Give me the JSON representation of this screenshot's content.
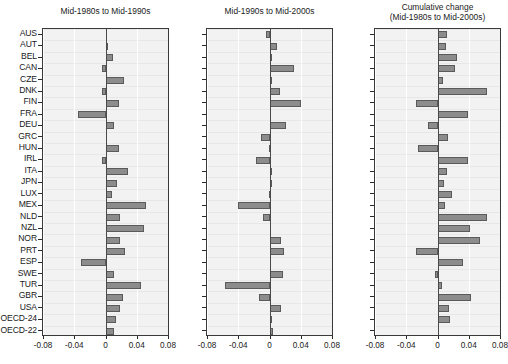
{
  "chart_data": {
    "type": "bar",
    "orientation": "horizontal",
    "title": "",
    "categories": [
      "AUS",
      "AUT",
      "BEL",
      "CAN",
      "CZE",
      "DNK",
      "FIN",
      "FRA",
      "DEU",
      "GRC",
      "HUN",
      "IRL",
      "ITA",
      "JPN",
      "LUX",
      "MEX",
      "NLD",
      "NZL",
      "NOR",
      "PRT",
      "ESP",
      "SWE",
      "TUR",
      "GBR",
      "USA",
      "OECD-24",
      "OECD-22"
    ],
    "xlabel": "",
    "ylabel": "",
    "xlim": [
      -0.08,
      0.08
    ],
    "xticks": [
      -0.08,
      -0.04,
      0,
      0.04,
      0.08
    ],
    "xticklabels": [
      "-0.08",
      "-0.04",
      "0",
      "0.04",
      "0.08"
    ],
    "grid": true,
    "legend": "none",
    "panels": [
      {
        "title_line1": "Mid-1980s to Mid-1990s",
        "title_line2": "",
        "values": [
          0.0,
          0.001,
          0.01,
          -0.004,
          0.024,
          -0.005,
          0.017,
          -0.035,
          0.011,
          0.0,
          0.017,
          -0.005,
          0.029,
          0.015,
          0.008,
          0.052,
          0.019,
          0.049,
          0.018,
          0.025,
          -0.032,
          0.011,
          0.046,
          0.023,
          0.019,
          0.014,
          0.011
        ]
      },
      {
        "title_line1": "Mid-1990s to Mid-2000s",
        "title_line2": "",
        "values": [
          -0.004,
          0.01,
          0.002,
          0.031,
          0.002,
          0.013,
          0.04,
          0.0,
          0.021,
          -0.011,
          -0.001,
          -0.017,
          0.003,
          0.001,
          -0.001,
          -0.04,
          -0.008,
          0.0,
          0.015,
          0.019,
          0.0,
          0.017,
          -0.057,
          -0.014,
          0.015,
          0.001,
          0.005
        ]
      },
      {
        "title_line1": "Cumulative change",
        "title_line2": "(Mid-1980s to Mid-2000s)",
        "values": [
          0.012,
          0.011,
          0.025,
          0.023,
          0.007,
          0.063,
          -0.028,
          0.039,
          -0.012,
          0.014,
          -0.025,
          0.039,
          0.012,
          0.008,
          0.018,
          0.009,
          0.063,
          0.041,
          0.054,
          -0.027,
          0.033,
          -0.003,
          0.006,
          0.043,
          0.015,
          0.016,
          0.0
        ]
      }
    ],
    "colors": {
      "bar_fill": "#8c8c8c",
      "bar_edge": "#5a5a5a",
      "plot_bg": "#f2f2f2",
      "axis": "#3a3a3a",
      "text": "#1a1a1a"
    }
  }
}
